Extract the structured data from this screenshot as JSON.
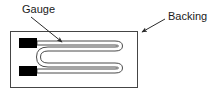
{
  "diagram": {
    "type": "strain-gauge-cross-section",
    "background_color": "#ffffff",
    "line_color": "#3a3a3a",
    "pad_color": "#000000",
    "text_color": "#1a1a1a",
    "labels": {
      "gauge": "Gauge",
      "backing": "Backing"
    },
    "annotations": [
      {
        "name": "gauge-leader",
        "label": "Gauge",
        "label_x": 22,
        "label_y": 13,
        "line_start_x": 31,
        "line_start_y": 17,
        "line_end_x": 63,
        "line_end_y": 43
      },
      {
        "name": "backing-leader",
        "label": "Backing",
        "label_x": 168,
        "label_y": 20,
        "line_start_x": 165,
        "line_start_y": 20,
        "line_end_x": 141,
        "line_end_y": 33
      }
    ],
    "backing_rect": {
      "name": "backing-substrate",
      "x": 10,
      "y": 31,
      "width": 128,
      "height": 57
    },
    "solder_pads": [
      {
        "name": "solder-pad-upper",
        "x": 19,
        "y": 38,
        "width": 18,
        "height": 10
      },
      {
        "name": "solder-pad-lower",
        "x": 19,
        "y": 66,
        "width": 18,
        "height": 10
      }
    ],
    "grid_path": {
      "name": "gauge-foil-grid",
      "description": "serpentine resistive foil",
      "stroke_width": 1,
      "outline": "M 37 41 L 115 41 Q 122 41 122 46 Q 122 51 115 51 L 48 51 Q 41 51 41 57 Q 41 63 48 63 L 115 63 Q 122 63 122 68 Q 122 73 115 73 L 37 73 L 37 69 L 115 69 Q 118 69 118 68 Q 118 67 115 67 L 48 67 Q 37 67 37 57 Q 37 47 48 47 L 115 47 Q 118 47 118 46 Q 118 45 115 45 L 37 45 Z"
    }
  }
}
